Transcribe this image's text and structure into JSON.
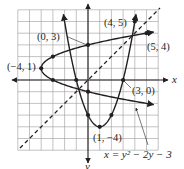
{
  "figure": {
    "axes": {
      "x_label": "x",
      "y_label": "y"
    },
    "equation_label": "x = y² − 2y − 3",
    "points": [
      {
        "label": "(0, 3)"
      },
      {
        "label": "(−4, 1)"
      },
      {
        "label": "(4, 5)"
      },
      {
        "label": "(5, 4)"
      },
      {
        "label": "(3, 0)"
      },
      {
        "label": "(1, −4)"
      }
    ]
  },
  "chart_data": {
    "type": "line",
    "title": "",
    "xlabel": "x",
    "ylabel": "y",
    "xlim": [
      -6,
      6
    ],
    "ylim": [
      -6,
      6
    ],
    "grid": true,
    "series": [
      {
        "name": "y = x² − 2x − 3",
        "style": "solid",
        "vertex": [
          1,
          -4
        ]
      },
      {
        "name": "x = y² − 2y − 3",
        "style": "solid",
        "vertex": [
          -4,
          1
        ]
      },
      {
        "name": "y = x",
        "style": "dashed"
      }
    ],
    "annotations": [
      {
        "text": "(0, 3)",
        "point": [
          0,
          3
        ]
      },
      {
        "text": "(−4, 1)",
        "point": [
          -4,
          1
        ]
      },
      {
        "text": "(4, 5)",
        "point": [
          4,
          5
        ]
      },
      {
        "text": "(5, 4)",
        "point": [
          5,
          4
        ]
      },
      {
        "text": "(3, 0)",
        "point": [
          3,
          0
        ]
      },
      {
        "text": "(1, −4)",
        "point": [
          1,
          -4
        ]
      },
      {
        "text": "x = y² − 2y − 3",
        "points_to": "sideways parabola"
      }
    ]
  }
}
